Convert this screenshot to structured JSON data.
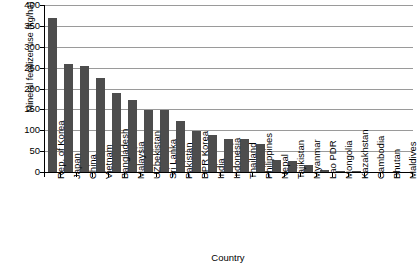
{
  "chart_data": {
    "type": "bar",
    "title": "",
    "xlabel": "Country",
    "ylabel": "Mineral fenilizer use (kg/ha)",
    "ylim": [
      0,
      400
    ],
    "yticks": [
      0,
      50,
      100,
      150,
      200,
      250,
      300,
      350,
      400
    ],
    "grid": true,
    "legend": false,
    "bar_color": "#4d4d4d",
    "categories": [
      "Rep. of Korea",
      "Japan",
      "China",
      "Vietnam",
      "Bangladesh",
      "Malaysia",
      "UZbekistan",
      "Sri Lanka",
      "Pakistan",
      "DPR Korea",
      "India",
      "Indonesia",
      "Thailand",
      "Philippines",
      "Nepal",
      "Tajikistan",
      "Myanmar",
      "Lao PDR",
      "Mongolia",
      "Kazakhstan",
      "Cambodia",
      "Bhutan",
      "Maldives"
    ],
    "values": [
      369,
      258,
      253,
      224,
      189,
      173,
      149,
      149,
      123,
      99,
      88,
      78,
      78,
      68,
      28,
      27,
      17,
      6,
      2,
      1,
      0,
      0,
      0
    ]
  },
  "axes": {
    "y_title": "Mineral fenilizer use (kg/ha)",
    "x_title": "Country"
  }
}
